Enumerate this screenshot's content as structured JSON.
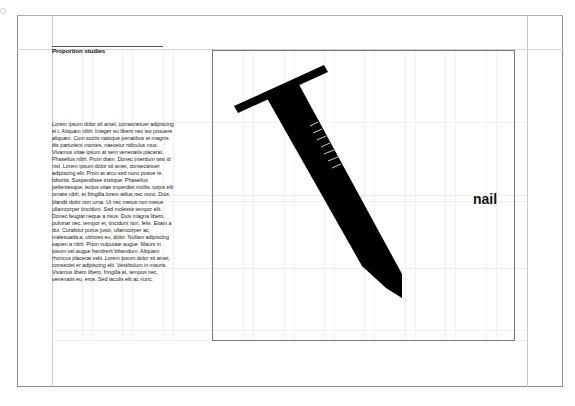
{
  "document": {
    "heading": "Proportion studies",
    "body": "Lorem ipsum dolor sit amet, consectetuer adipiscing el t. Aliquam nibh. Integer eu libero nec leo posuere aliquam. Cum sociis natoque penatibus et magnis dis parturient montes, nascetur ridiculus mus. Vivamus vitae ipsum at sem venenatis placerat. Phasellus nibh. Proin diam. Donec interdum wisi id nisl. Lorem ipsum dolor sit amet, consectetuer adipiscing elit. Proin at arcu sed nunc posue re lobortis. Suspendisse tristique. Phasellus pellentesque, lectus vitae imperdiet mollis, turpis elit ornare nibh, et fringilla lorem tellus nec nunc. Duis blandit dolor non urna. Ut nec metus non metus ullamcorper tincidunt. Sed molestie tempor elit. Donec feugiat neque a risus. Duis magna libero, pulvinar nec, tempor et, tincidunt non, felis. Etiam a dui. Curabitur purus justo, ullamcorper ac, malesuada a, ultricies eu, dolor. Nullam adipiscing sapien a nibh. Proin vulputate augue. Maurs in ipsum vel augue hendrerit bibendum. Aliquam rhoncus placerat velit. Lorem ipsum dolor sit amet, consectet er adipiscing elit. Vestibulum in mauris. Vivamus libero libero, fringilla at, tempus nec, venenatis eu, eros. Sed iaculis elit ac nunc.",
    "figure_label": "nail",
    "figure_icon": "nail-illustration"
  },
  "colors": {
    "ink": "#000000",
    "frame": "#777777",
    "guides": "#c8c8c8"
  }
}
